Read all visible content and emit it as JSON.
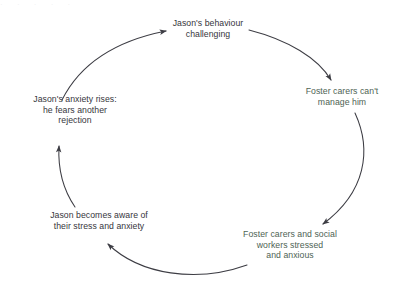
{
  "diagram": {
    "type": "cyclical-flow",
    "background_color": "#ffffff",
    "arrow_color": "#3d3d44",
    "node_text_color_dark": "#36363c",
    "node_text_color_green": "#4e6354",
    "direction": "clockwise",
    "nodes": [
      {
        "id": "behaviour",
        "text": "Jason's behaviour\nchallenging",
        "position": "top",
        "color": "#36363c"
      },
      {
        "id": "carers-cope",
        "text": "Foster carers can't\nmanage him",
        "position": "right",
        "color": "#4e6354"
      },
      {
        "id": "carers-stressed",
        "text": "Foster carers and social\nworkers stressed\nand anxious",
        "position": "bottom-right",
        "color": "#4e6354"
      },
      {
        "id": "jason-aware",
        "text": "Jason becomes aware of\ntheir stress and anxiety",
        "position": "bottom-left",
        "color": "#36363c"
      },
      {
        "id": "jason-anxiety",
        "text": "Jason's anxiety rises:\nhe fears another\nrejection",
        "position": "left",
        "color": "#36363c"
      }
    ],
    "arrows": [
      {
        "id": "arrow-behaviour-to-carers-cope",
        "from": "behaviour",
        "to": "carers-cope"
      },
      {
        "id": "arrow-carers-cope-to-stressed",
        "from": "carers-cope",
        "to": "carers-stressed"
      },
      {
        "id": "arrow-stressed-to-jason-aware",
        "from": "carers-stressed",
        "to": "jason-aware"
      },
      {
        "id": "arrow-jason-aware-to-anxiety",
        "from": "jason-aware",
        "to": "jason-anxiety"
      },
      {
        "id": "arrow-anxiety-to-behaviour",
        "from": "jason-anxiety",
        "to": "behaviour"
      }
    ],
    "top_bleed_text": "· · · · ·"
  }
}
